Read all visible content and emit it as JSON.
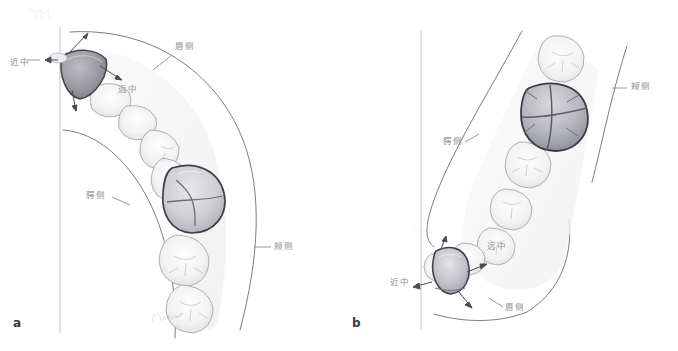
{
  "figure": {
    "type": "dental-anatomy-illustration",
    "style": "pencil drawing",
    "background_color": "#ffffff",
    "ink_color": "#6f6f74",
    "label_color": "#8d8d90",
    "panels": [
      {
        "id": "a",
        "letter": "a",
        "arch": "maxillary",
        "highlighted_teeth": [
          "central incisor",
          "first molar"
        ],
        "labels": [
          {
            "name": "mesial",
            "text": "近中",
            "x": 10,
            "y": 60
          },
          {
            "name": "distal",
            "text": "远中",
            "x": 118,
            "y": 87
          },
          {
            "name": "labial",
            "text": "唇侧",
            "x": 175,
            "y": 44
          },
          {
            "name": "palatal",
            "text": "腭侧",
            "x": 86,
            "y": 192
          },
          {
            "name": "buccal",
            "text": "颊侧",
            "x": 274,
            "y": 243
          }
        ]
      },
      {
        "id": "b",
        "letter": "b",
        "arch": "mandibular",
        "highlighted_teeth": [
          "central incisor",
          "first molar"
        ],
        "labels": [
          {
            "name": "buccal",
            "text": "颊侧",
            "x": 631,
            "y": 84
          },
          {
            "name": "palatal",
            "text": "腭侧",
            "x": 443,
            "y": 139
          },
          {
            "name": "distal",
            "text": "远中",
            "x": 487,
            "y": 244
          },
          {
            "name": "mesial",
            "text": "近中",
            "x": 390,
            "y": 280
          },
          {
            "name": "labial",
            "text": "唇侧",
            "x": 505,
            "y": 305
          }
        ]
      }
    ],
    "signature": {
      "name": "artist-signature",
      "text": ""
    }
  }
}
